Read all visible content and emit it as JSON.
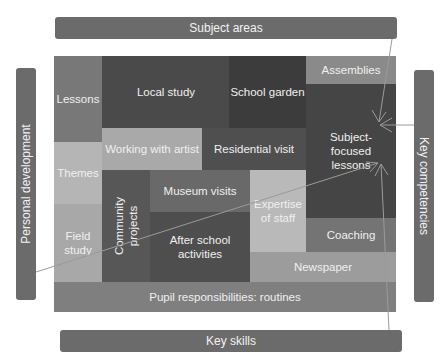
{
  "frame_labels": {
    "top": "Subject areas",
    "bottom": "Key skills",
    "left": "Personal development",
    "right": "Key competencies"
  },
  "blocks": {
    "lessons": "Lessons",
    "local_study": "Local study",
    "school_garden": "School garden",
    "assemblies": "Assemblies",
    "subject_focused_line1": "Subject-",
    "subject_focused_line2": "focused",
    "subject_focused_line3": "lessons",
    "working_with_artist": "Working with artist",
    "residential_visit": "Residential visit",
    "themes": "Themes",
    "museum_visits": "Museum visits",
    "expertise_line1": "Expertise",
    "expertise_line2": "of staff",
    "community_line1": "Community",
    "community_line2": "projects",
    "field_line1": "Field",
    "field_line2": "study",
    "after_school_line1": "After school",
    "after_school_line2": "activities",
    "coaching": "Coaching",
    "newspaper": "Newspaper",
    "pupil_responsibilities": "Pupil responsibilities: routines"
  },
  "colors": {
    "frame_bar": "#6b6b6b",
    "darkest": "#3f3f3f",
    "dark": "#4d4d4d",
    "mid": "#747474",
    "light": "#a6a6a6",
    "lighter": "#b8b8b8",
    "arrow": "#9a9a9a"
  }
}
